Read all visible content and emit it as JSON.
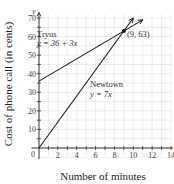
{
  "chart_data": {
    "type": "line",
    "title": "",
    "xlabel": "Number of minutes",
    "ylabel": "Cost of phone call (in cents)",
    "y_axis_var": "y",
    "xlim": [
      0,
      14
    ],
    "ylim": [
      0,
      70
    ],
    "x_ticks": [
      2,
      4,
      6,
      8,
      10,
      12,
      14
    ],
    "y_ticks": [
      10,
      20,
      30,
      40,
      50,
      60,
      70
    ],
    "origin_label": "0",
    "grid": true,
    "series": [
      {
        "name": "Tryus",
        "equation": "y = 36 + 3x",
        "slope": 3,
        "intercept": 36,
        "x": [
          0,
          11
        ],
        "y": [
          36,
          69
        ]
      },
      {
        "name": "Newtown",
        "equation": "y = 7x",
        "slope": 7,
        "intercept": 0,
        "x": [
          0,
          10
        ],
        "y": [
          0,
          70
        ]
      }
    ],
    "annotations": [
      {
        "text": "(9, 63)",
        "x": 9,
        "y": 63,
        "type": "intersection-point"
      }
    ]
  }
}
